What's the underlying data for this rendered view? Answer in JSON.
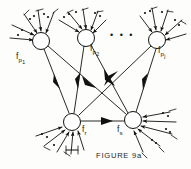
{
  "figure": {
    "caption": "FIGURE 9a",
    "ink_color": "#111111",
    "background_color": "#fdfdfb",
    "ellipsis": "• • •",
    "nodes": [
      {
        "id": "p1",
        "label_f": "f",
        "label_sub": "p",
        "label_subsub": "1",
        "cx": 41,
        "cy": 41,
        "r": 8.5,
        "label_x": 16,
        "label_y": 53
      },
      {
        "id": "p2",
        "label_f": "f",
        "label_sub": "p",
        "label_subsub": "2",
        "cx": 86,
        "cy": 38,
        "r": 8.5,
        "label_x": 90,
        "label_y": 46
      },
      {
        "id": "pj",
        "label_f": "f",
        "label_sub": "p",
        "label_subsub": "j",
        "cx": 157,
        "cy": 40,
        "r": 8.5,
        "label_x": 158,
        "label_y": 48
      },
      {
        "id": "r",
        "label_f": "f",
        "label_sub": "r",
        "label_subsub": "",
        "cx": 72,
        "cy": 122,
        "r": 8.5,
        "label_x": 82,
        "label_y": 127
      },
      {
        "id": "s",
        "label_f": "f",
        "label_sub": "s",
        "label_subsub": "",
        "cx": 133,
        "cy": 120,
        "r": 8.5,
        "label_x": 117,
        "label_y": 127
      }
    ],
    "internal_edges": [
      {
        "from": "p1",
        "to": "r",
        "direction": "down"
      },
      {
        "from": "p1",
        "to": "s",
        "direction": "down"
      },
      {
        "from": "p2",
        "to": "r",
        "direction": "down"
      },
      {
        "from": "p2",
        "to": "s",
        "direction": "down"
      },
      {
        "from": "pj",
        "to": "r",
        "direction": "down"
      },
      {
        "from": "pj",
        "to": "s",
        "direction": "down"
      },
      {
        "from": "r",
        "to": "s",
        "direction": "right"
      }
    ],
    "ellipsis_position": {
      "x": 110,
      "y": 36
    },
    "external_arrow_groups": [
      {
        "node": "p1",
        "count": 5,
        "type": "incoming-fan-top"
      },
      {
        "node": "p2",
        "count": 5,
        "type": "incoming-fan-top"
      },
      {
        "node": "pj",
        "count": 5,
        "type": "incoming-fan-top"
      },
      {
        "node": "r",
        "count": 5,
        "type": "incoming-fan-bottom"
      },
      {
        "node": "s",
        "count": 5,
        "type": "incoming-fan-bottom"
      }
    ]
  }
}
